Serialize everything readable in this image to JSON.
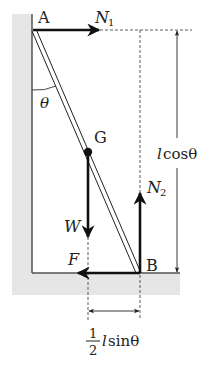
{
  "diagram": {
    "type": "free-body diagram",
    "points": {
      "A": "A",
      "B": "B",
      "G": "G"
    },
    "forces": {
      "N1": {
        "symbol": "N",
        "subscript": "1",
        "direction": "right"
      },
      "N2": {
        "symbol": "N",
        "subscript": "2",
        "direction": "up"
      },
      "W": {
        "symbol": "W",
        "direction": "down"
      },
      "F": {
        "symbol": "F",
        "direction": "left"
      }
    },
    "angle_label": "θ",
    "dimensions": {
      "vertical": {
        "prefix": "l",
        "text": "cosθ"
      },
      "horizontal": {
        "numerator": "1",
        "denominator": "2",
        "prefix": "l",
        "text": "sinθ"
      }
    },
    "colors": {
      "wall_fill": "#e6e6e6",
      "line": "#222222",
      "surface_line": "#555555"
    }
  }
}
